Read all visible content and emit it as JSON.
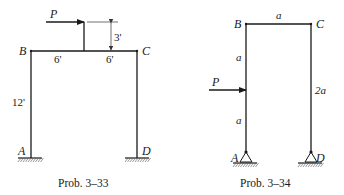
{
  "figures": [
    {
      "caption": "Prob. 3–33",
      "load_label": "P",
      "joints": {
        "A": "A",
        "B": "B",
        "C": "C",
        "D": "D"
      },
      "dimensions": {
        "column_height": "12'",
        "beam_left": "6'",
        "beam_right": "6'",
        "post_height": "3'"
      },
      "supports": "fixed"
    },
    {
      "caption": "Prob. 3–34",
      "load_label": "P",
      "joints": {
        "A": "A",
        "B": "B",
        "C": "C",
        "D": "D"
      },
      "dimensions": {
        "beam_span": "a",
        "left_upper": "a",
        "left_lower": "a",
        "right_height": "2a"
      },
      "supports": "pinned"
    }
  ]
}
